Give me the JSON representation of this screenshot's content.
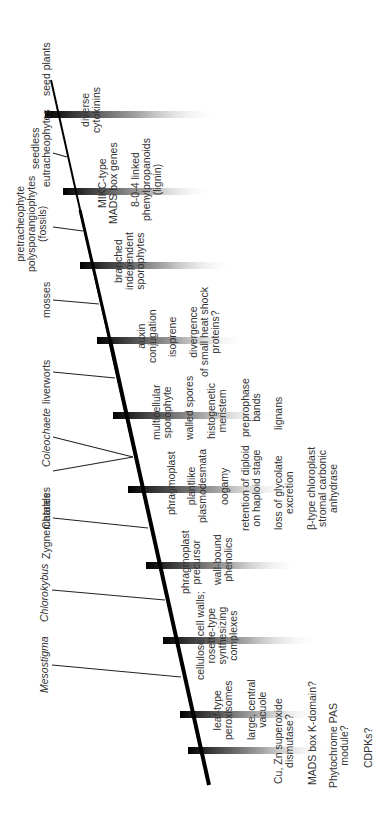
{
  "diagram": {
    "type": "cladogram",
    "orientation": "rotated -90deg",
    "colors": {
      "line": "#000000",
      "bar_dark": "#111111",
      "text": "#333333",
      "background": "#ffffff"
    },
    "taxa": [
      {
        "id": "seed-plants",
        "label": "seed plants",
        "italic": false
      },
      {
        "id": "seedless-eutracheophytes",
        "label": "seedless\neutracheophytes",
        "italic": false
      },
      {
        "id": "pretracheophyte",
        "label": "pretracheophyte\npolysporangiophytes\n(fossils)",
        "italic": false
      },
      {
        "id": "mosses",
        "label": "mosses",
        "italic": false
      },
      {
        "id": "liverworts",
        "label": "liverworts",
        "italic": false
      },
      {
        "id": "coleochaete",
        "label": "Coleochaete",
        "italic": true
      },
      {
        "id": "charales",
        "label": "Charales",
        "italic": false
      },
      {
        "id": "zygnematales",
        "label": "Zygnematales",
        "italic": false
      },
      {
        "id": "chlorokybus",
        "label": "Chlorokybus",
        "italic": true
      },
      {
        "id": "mesostigma",
        "label": "Mesostigma",
        "italic": true
      }
    ],
    "traits": [
      {
        "id": "t1",
        "label": "diverse\ncytokinins"
      },
      {
        "id": "t2",
        "label": "MIKC-type\nMADS box genes"
      },
      {
        "id": "t3",
        "label": "8-0-4 linked\nphenylpropanoids\n(lignin)"
      },
      {
        "id": "t4",
        "label": "branched\nindependent\nsporophytes"
      },
      {
        "id": "t5",
        "label": "auxin\nconjugation"
      },
      {
        "id": "t6",
        "label": "isoprene"
      },
      {
        "id": "t7",
        "label": "divergence\nof small heat shock\nproteins?"
      },
      {
        "id": "t8",
        "label": "multicellular\nsporophyte"
      },
      {
        "id": "t9",
        "label": "walled spores"
      },
      {
        "id": "t10",
        "label": "histogenetic\nmeristem"
      },
      {
        "id": "t11",
        "label": "preprophase\nbands"
      },
      {
        "id": "t12",
        "label": "lignans"
      },
      {
        "id": "t13",
        "label": "phragmoplast"
      },
      {
        "id": "t14",
        "label": "plantlike\nplasmodesmata"
      },
      {
        "id": "t15",
        "label": "oogamy"
      },
      {
        "id": "t16",
        "label": "retention of diploid\non haploid stage"
      },
      {
        "id": "t17",
        "label": "loss of glycolate\nexcretion"
      },
      {
        "id": "t18",
        "label": "β-type chloroplast\nstromal carbonic\nanhydrase"
      },
      {
        "id": "t19",
        "label": "phragmoplast\nprecursor"
      },
      {
        "id": "t20",
        "label": "wall-bound\nphenolics"
      },
      {
        "id": "t21",
        "label": "cellulose cell walls;\nrosette-type\nsynthesizing\ncomplexes"
      },
      {
        "id": "t22",
        "label": "leaf-type\nperoxisomes"
      },
      {
        "id": "t23",
        "label": "large, central\nvacuole"
      },
      {
        "id": "t24",
        "label": "Cu, Zn superoxide\ndismutase?"
      },
      {
        "id": "t25",
        "label": "MADS box K-domain?"
      },
      {
        "id": "t26",
        "label": "Phytochrome PAS\nmodule?"
      },
      {
        "id": "t27",
        "label": "CDPKs?"
      }
    ]
  }
}
